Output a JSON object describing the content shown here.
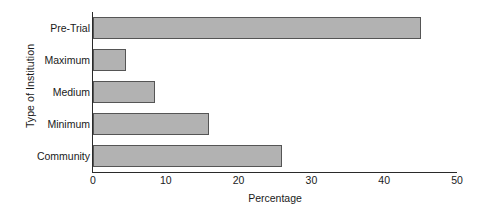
{
  "chart_data": {
    "type": "bar",
    "orientation": "horizontal",
    "title": "",
    "xlabel": "Percentage",
    "ylabel": "Type of Institution",
    "categories": [
      "Pre-Trial",
      "Maximum",
      "Medium",
      "Minimum",
      "Community"
    ],
    "values": [
      45,
      4.5,
      8.5,
      16,
      26
    ],
    "xlim": [
      0,
      50
    ],
    "xticks": [
      0,
      10,
      20,
      30,
      40,
      50
    ],
    "xtick_labels": [
      "0",
      "10",
      "20",
      "30",
      "40",
      "50"
    ],
    "grid": false,
    "legend": false,
    "bar_fill_color": "#b2b2b2",
    "bar_border_color": "#555555",
    "background_color": "#ffffff",
    "axis_color": "#2a2a2a"
  }
}
